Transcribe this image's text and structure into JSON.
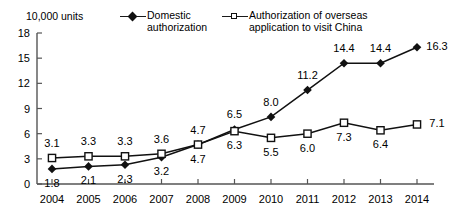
{
  "units_note": "10,000 units",
  "legend": {
    "domestic": {
      "label_line1": "Domestic",
      "label_line2": "authorization",
      "marker": "filled-diamond"
    },
    "overseas": {
      "label_line1": "Authorization of overseas",
      "label_line2": "application to visit China",
      "marker": "open-square"
    }
  },
  "chart_data": {
    "type": "line",
    "title": "",
    "subtitle": "",
    "xlabel": "",
    "ylabel": "10,000 units",
    "categories": [
      "2004",
      "2005",
      "2006",
      "2007",
      "2008",
      "2009",
      "2010",
      "2011",
      "2012",
      "2013",
      "2014"
    ],
    "x_ticks": [
      "2004",
      "2005",
      "2006",
      "2007",
      "2008",
      "2009",
      "2010",
      "2011",
      "2012",
      "2013",
      "2014"
    ],
    "y_ticks": [
      "0",
      "3",
      "6",
      "9",
      "12",
      "15",
      "18"
    ],
    "ylim": [
      0,
      18
    ],
    "grid": false,
    "legend_position": "top",
    "series": [
      {
        "name": "Domestic authorization",
        "marker": "filled-diamond",
        "values": [
          1.8,
          2.1,
          2.3,
          3.2,
          4.7,
          6.5,
          8.0,
          11.2,
          14.4,
          14.4,
          16.3
        ],
        "labels": [
          "1.8",
          "2.1",
          "2.3",
          "3.2",
          "4.7",
          "6.5",
          "8.0",
          "11.2",
          "14.4",
          "14.4",
          "16.3"
        ],
        "label_positions": [
          "below",
          "below",
          "below",
          "below",
          "below",
          "above",
          "above",
          "above",
          "above",
          "above",
          "right"
        ]
      },
      {
        "name": "Authorization of overseas application to visit China",
        "marker": "open-square",
        "values": [
          3.1,
          3.3,
          3.3,
          3.6,
          4.7,
          6.3,
          5.5,
          6.0,
          7.3,
          6.4,
          7.1
        ],
        "labels": [
          "3.1",
          "3.3",
          "3.3",
          "3.6",
          "4.7",
          "6.3",
          "5.5",
          "6.0",
          "7.3",
          "6.4",
          "7.1"
        ],
        "label_positions": [
          "above",
          "above",
          "above",
          "above",
          "above",
          "below",
          "below",
          "below",
          "below",
          "below",
          "right"
        ]
      }
    ]
  }
}
